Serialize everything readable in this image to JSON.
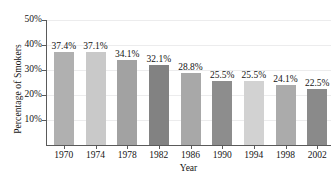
{
  "chart_data": {
    "type": "bar",
    "title": "",
    "xlabel": "Year",
    "ylabel": "Percentage of Smokers",
    "categories": [
      "1970",
      "1974",
      "1978",
      "1982",
      "1986",
      "1990",
      "1994",
      "1998",
      "2002"
    ],
    "values": [
      37.4,
      37.1,
      34.1,
      32.1,
      28.8,
      25.5,
      25.5,
      24.1,
      22.5
    ],
    "data_labels": [
      "37.4%",
      "37.1%",
      "34.1%",
      "32.1%",
      "28.8%",
      "25.5%",
      "25.5%",
      "24.1%",
      "22.5%"
    ],
    "bar_colors": [
      "#b0b0b0",
      "#c9c9c9",
      "#a2a2a2",
      "#828282",
      "#a8a8a8",
      "#8d8d8d",
      "#d2d2d2",
      "#ababab",
      "#8a8a8a"
    ],
    "ylim": [
      0,
      50
    ],
    "ytick_values": [
      10,
      20,
      30,
      40,
      50
    ],
    "ytick_labels": [
      "10%",
      "20%",
      "30%",
      "40%",
      "50%"
    ],
    "grid": true,
    "grid_color": "#ececed",
    "legend": "none",
    "axis_color": "#5a5a5a",
    "text_color": "#141414",
    "background": "#ffffff"
  }
}
